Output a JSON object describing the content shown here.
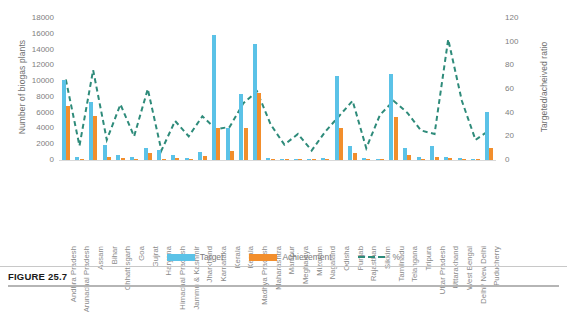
{
  "figure": {
    "caption": "FIGURE 25.7"
  },
  "chart_data": {
    "type": "bar",
    "title": "",
    "xlabel": "",
    "ylabel": "Number of biogas plants",
    "y2label": "Targeted/acheived ratio",
    "ylim": [
      0,
      18000
    ],
    "y2lim": [
      0,
      120
    ],
    "yticks": [
      "0",
      "2000",
      "4000",
      "6000",
      "8000",
      "10000",
      "12000",
      "14000",
      "16000",
      "18000"
    ],
    "y2ticks": [
      "0",
      "20",
      "40",
      "60",
      "80",
      "100",
      "120"
    ],
    "grid": false,
    "legend_position": "bottom",
    "categories": [
      "Andhra Pradesh",
      "Arunachal Pradesh",
      "Assam",
      "Bihar",
      "Chhattisgarh",
      "Goa",
      "Gujrat",
      "Haryana",
      "Himachal Pradesh",
      "Jammu & Kashmir",
      "Jharkhand",
      "Karnataka",
      "Kerala",
      "Kerala",
      "Madhya Pradesh",
      "Maharashtra",
      "Manipur",
      "Meghalaya",
      "Mizoram",
      "Nagaland",
      "Odisha",
      "Punjab",
      "Rajasthan",
      "Sikkim",
      "Tamilnadu",
      "Telangana",
      "Tripura",
      "Uttar Pradesh",
      "Uttarakhand",
      "West Bengal",
      "Delhi/ New Delhi",
      "Puducherry"
    ],
    "series": [
      {
        "name": "Target",
        "color": "#5bc2e7",
        "values": [
          10200,
          400,
          7400,
          1900,
          600,
          400,
          1500,
          1300,
          600,
          300,
          1000,
          15900,
          4000,
          8400,
          14700,
          200,
          80,
          90,
          60,
          250,
          10700,
          1800,
          300,
          80,
          10900,
          1500,
          400,
          1800,
          400,
          200,
          120,
          6100
        ]
      },
      {
        "name": "Achievement",
        "color": "#f28e2c",
        "values": [
          6900,
          50,
          5600,
          320,
          280,
          80,
          900,
          100,
          200,
          60,
          500,
          4100,
          1100,
          4000,
          8500,
          60,
          10,
          20,
          5,
          60,
          4000,
          900,
          30,
          20,
          5400,
          600,
          100,
          400,
          200,
          20,
          20,
          1500
        ]
      }
    ],
    "percent_series": {
      "name": "%",
      "color": "#2e8b7a",
      "style": "dashed",
      "axis": "secondary",
      "values": [
        68,
        12,
        76,
        17,
        47,
        20,
        60,
        8,
        33,
        20,
        37,
        26,
        28,
        48,
        58,
        30,
        13,
        22,
        8,
        24,
        37,
        50,
        10,
        38,
        50,
        40,
        25,
        22,
        102,
        50,
        17,
        25
      ]
    }
  },
  "legend": {
    "items": [
      {
        "label": "Target",
        "marker": "bar-swatch-blue"
      },
      {
        "label": "Achievement",
        "marker": "bar-swatch-orange"
      },
      {
        "label": "%",
        "marker": "dashed-line-green"
      }
    ]
  }
}
